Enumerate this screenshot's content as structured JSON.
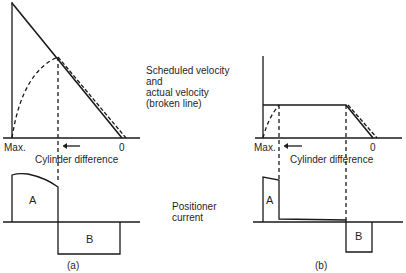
{
  "panel_a": {
    "caption": "(a)",
    "x_axis": {
      "left_label": "Max.",
      "right_label": "0",
      "title": "Cylinder difference"
    },
    "region_labels": {
      "positive": "A",
      "negative": "B"
    }
  },
  "panel_b": {
    "caption": "(b)",
    "x_axis": {
      "left_label": "Max.",
      "right_label": "0",
      "title": "Cylinder difference"
    },
    "region_labels": {
      "positive": "A",
      "negative": "B"
    }
  },
  "legend": {
    "velocity_line1": "Scheduled velocity",
    "velocity_line2": "and",
    "velocity_line3": "actual velocity",
    "velocity_line4": "(broken line)",
    "current_line1": "Positioner",
    "current_line2": "current"
  },
  "colors": {
    "line": "#1a1a1a",
    "background": "#ffffff"
  }
}
